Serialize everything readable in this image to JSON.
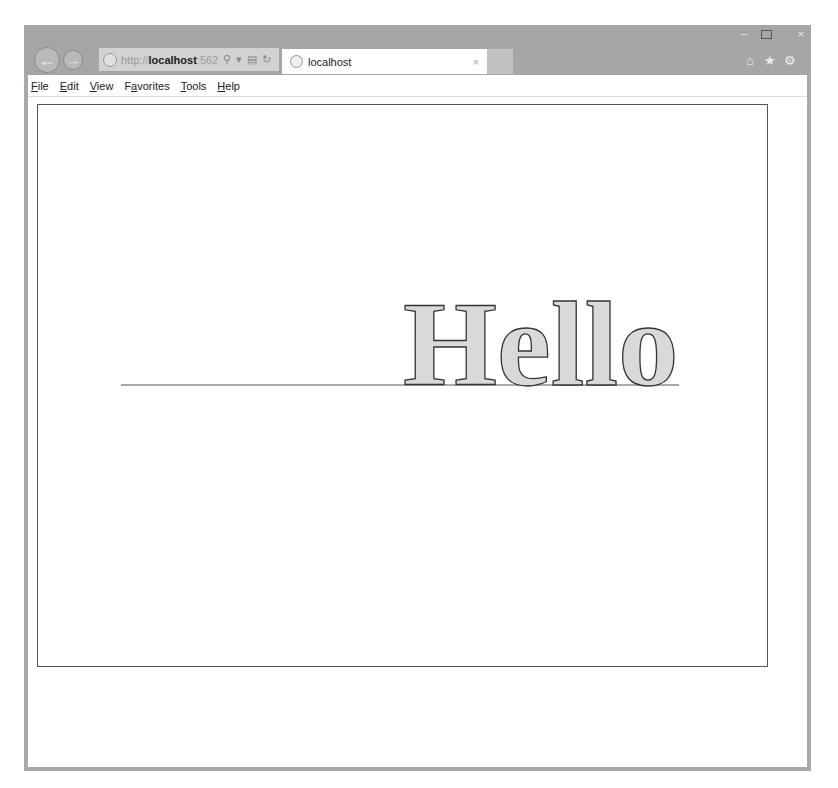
{
  "browser": {
    "address": {
      "protocol": "http://",
      "host": "localhost",
      "port_partial": ":562"
    },
    "tab": {
      "title": "localhost"
    },
    "menu": [
      {
        "accel": "F",
        "rest": "ile"
      },
      {
        "accel": "E",
        "rest": "dit"
      },
      {
        "accel": "V",
        "rest": "iew"
      },
      {
        "pre": "F",
        "accel": "a",
        "rest": "vorites"
      },
      {
        "accel": "T",
        "rest": "ools"
      },
      {
        "accel": "H",
        "rest": "elp"
      }
    ],
    "icons": {
      "back": "←",
      "forward": "→",
      "search": "⚲",
      "dropdown": "▾",
      "compat": "▤",
      "refresh": "↻",
      "close_tab": "×",
      "minimize": "–",
      "close_window": "×",
      "home": "⌂",
      "favorites": "★",
      "settings": "⚙"
    }
  },
  "page": {
    "text": "Hello",
    "colors": {
      "fill": "#d9d9d9",
      "stroke": "#333333",
      "line": "#555555"
    }
  }
}
